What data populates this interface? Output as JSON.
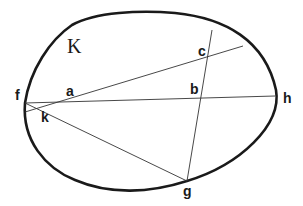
{
  "diagram": {
    "region_label": "K",
    "points": {
      "a": {
        "label": "a",
        "x": 70,
        "y": 99
      },
      "b": {
        "label": "b",
        "x": 202,
        "y": 98
      },
      "c": {
        "label": "c",
        "x": 208,
        "y": 59
      },
      "f": {
        "label": "f",
        "x": 25,
        "y": 103
      },
      "g": {
        "label": "g",
        "x": 187,
        "y": 181
      },
      "h": {
        "label": "h",
        "x": 275,
        "y": 96
      },
      "k": {
        "label": "k",
        "x": 40,
        "y": 111
      }
    },
    "segments": [
      {
        "name": "chord-f-h",
        "from": "f",
        "to": "h"
      },
      {
        "name": "chord-through-a-c",
        "from": [
          25,
          112
        ],
        "to": [
          243,
          46
        ]
      },
      {
        "name": "chord-g-through-b-c",
        "from": "g",
        "to": [
          212,
          30
        ]
      },
      {
        "name": "chord-f-g",
        "from": "f",
        "to": "g"
      }
    ],
    "colors": {
      "stroke": "#1a1a1a",
      "background": "#ffffff"
    }
  }
}
